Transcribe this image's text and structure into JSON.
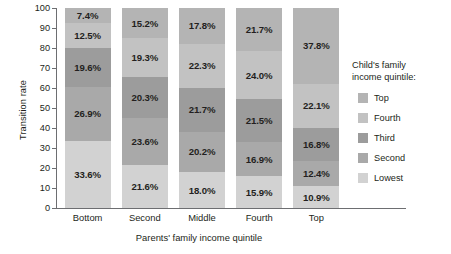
{
  "chart_data": {
    "type": "bar",
    "subtype": "stacked-bar-100",
    "title": "",
    "xlabel": "Parents' family income quintile",
    "ylabel": "Transition rate",
    "ylim": [
      0,
      100
    ],
    "yticks": [
      0,
      10,
      20,
      30,
      40,
      50,
      60,
      70,
      80,
      90,
      100
    ],
    "ytick_labels": [
      "0",
      "10",
      "20",
      "30",
      "40",
      "50",
      "60",
      "70",
      "80",
      "90",
      "100"
    ],
    "grid": false,
    "legend_position": "right",
    "legend_title": "Child's family\nincome quintile:",
    "categories": [
      "Bottom",
      "Second",
      "Middle",
      "Fourth",
      "Top"
    ],
    "series": [
      {
        "name": "Lowest",
        "color": "#d2d2d2",
        "values": [
          33.6,
          21.6,
          18.0,
          15.9,
          10.9
        ],
        "labels": [
          "33.6%",
          "21.6%",
          "18.0%",
          "15.9%",
          "10.9%"
        ]
      },
      {
        "name": "Second",
        "color": "#a9a9a9",
        "values": [
          26.9,
          23.6,
          20.2,
          16.9,
          12.4
        ],
        "labels": [
          "26.9%",
          "23.6%",
          "20.2%",
          "16.9%",
          "12.4%"
        ]
      },
      {
        "name": "Third",
        "color": "#9c9c9c",
        "values": [
          19.6,
          20.3,
          21.7,
          21.5,
          16.8
        ],
        "labels": [
          "19.6%",
          "20.3%",
          "21.7%",
          "21.5%",
          "16.8%"
        ]
      },
      {
        "name": "Fourth",
        "color": "#c2c2c2",
        "values": [
          12.5,
          19.3,
          22.3,
          24.0,
          22.1
        ],
        "labels": [
          "12.5%",
          "19.3%",
          "22.3%",
          "24.0%",
          "22.1%"
        ]
      },
      {
        "name": "Top",
        "color": "#b4b4b4",
        "values": [
          7.4,
          15.2,
          17.8,
          21.7,
          37.8
        ],
        "labels": [
          "7.4%",
          "15.2%",
          "17.8%",
          "21.7%",
          "37.8%"
        ]
      }
    ],
    "legend_order": [
      "Top",
      "Fourth",
      "Third",
      "Second",
      "Lowest"
    ],
    "axis_color": "#6d6e71",
    "label_color": "#231f20",
    "background": "#ffffff"
  }
}
